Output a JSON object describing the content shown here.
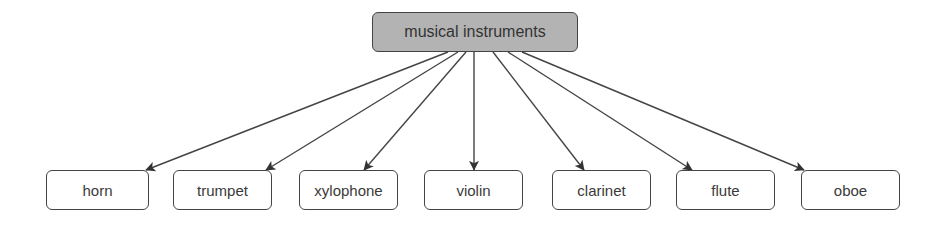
{
  "diagram": {
    "type": "tree",
    "root": {
      "label": "musical instruments",
      "fill": "#b3b3b3",
      "box": [
        372,
        12,
        206,
        40
      ]
    },
    "children": [
      {
        "label": "horn",
        "box": [
          46,
          170,
          103,
          40
        ],
        "from": [
          448,
          52
        ],
        "to": [
          146,
          170
        ]
      },
      {
        "label": "trumpet",
        "box": [
          173,
          170,
          99,
          40
        ],
        "from": [
          458,
          52
        ],
        "to": [
          266,
          170
        ]
      },
      {
        "label": "xylophone",
        "box": [
          299,
          170,
          99,
          40
        ],
        "from": [
          466,
          52
        ],
        "to": [
          364,
          170
        ]
      },
      {
        "label": "violin",
        "box": [
          424,
          170,
          99,
          40
        ],
        "from": [
          474,
          52
        ],
        "to": [
          474,
          170
        ]
      },
      {
        "label": "clarinet",
        "box": [
          552,
          170,
          99,
          40
        ],
        "from": [
          493,
          52
        ],
        "to": [
          584,
          170
        ]
      },
      {
        "label": "flute",
        "box": [
          676,
          170,
          99,
          40
        ],
        "from": [
          508,
          52
        ],
        "to": [
          692,
          170
        ]
      },
      {
        "label": "oboe",
        "box": [
          801,
          170,
          99,
          40
        ],
        "from": [
          522,
          52
        ],
        "to": [
          804,
          170
        ]
      }
    ],
    "edge_color": "#444444",
    "border_color": "#444444"
  }
}
